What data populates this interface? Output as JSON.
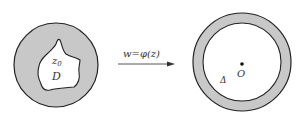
{
  "diagram": {
    "left_region": {
      "z_label": "z",
      "z_subscript": "0",
      "domain_label": "D",
      "fill_color": "#c8c8c8",
      "stroke_color": "#222222"
    },
    "mapping": {
      "label": "w=φ(z)"
    },
    "right_region": {
      "center_label": "O",
      "region_label": "Δ",
      "fill_color": "#c8c8c8",
      "stroke_color": "#222222"
    }
  }
}
